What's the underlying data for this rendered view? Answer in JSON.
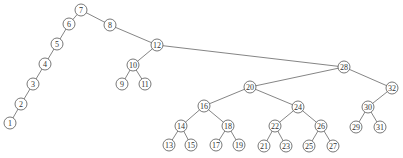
{
  "diagram": {
    "type": "binary-tree",
    "node_radius": 6,
    "colors": {
      "edge": "#666666",
      "node_stroke": "#555555",
      "node_fill": "#ffffff",
      "label": "#333333"
    },
    "nodes": [
      {
        "id": "7",
        "label": "7",
        "x": 81,
        "y": 10
      },
      {
        "id": "6",
        "label": "6",
        "x": 69,
        "y": 24
      },
      {
        "id": "5",
        "label": "5",
        "x": 57,
        "y": 44
      },
      {
        "id": "4",
        "label": "4",
        "x": 45,
        "y": 64
      },
      {
        "id": "3",
        "label": "3",
        "x": 33,
        "y": 84
      },
      {
        "id": "2",
        "label": "2",
        "x": 21,
        "y": 104
      },
      {
        "id": "1",
        "label": "1",
        "x": 10,
        "y": 123
      },
      {
        "id": "8",
        "label": "8",
        "x": 110,
        "y": 25
      },
      {
        "id": "12",
        "label": "12",
        "x": 157,
        "y": 45
      },
      {
        "id": "10",
        "label": "10",
        "x": 133,
        "y": 65
      },
      {
        "id": "9",
        "label": "9",
        "x": 122,
        "y": 84
      },
      {
        "id": "11",
        "label": "11",
        "x": 145,
        "y": 84
      },
      {
        "id": "28",
        "label": "28",
        "x": 344,
        "y": 67
      },
      {
        "id": "20",
        "label": "20",
        "x": 250,
        "y": 87
      },
      {
        "id": "16",
        "label": "16",
        "x": 204,
        "y": 106
      },
      {
        "id": "14",
        "label": "14",
        "x": 181,
        "y": 126
      },
      {
        "id": "18",
        "label": "18",
        "x": 228,
        "y": 126
      },
      {
        "id": "13",
        "label": "13",
        "x": 169,
        "y": 145
      },
      {
        "id": "15",
        "label": "15",
        "x": 191,
        "y": 145
      },
      {
        "id": "17",
        "label": "17",
        "x": 216,
        "y": 145
      },
      {
        "id": "19",
        "label": "19",
        "x": 239,
        "y": 145
      },
      {
        "id": "24",
        "label": "24",
        "x": 298,
        "y": 107
      },
      {
        "id": "22",
        "label": "22",
        "x": 275,
        "y": 126
      },
      {
        "id": "26",
        "label": "26",
        "x": 321,
        "y": 126
      },
      {
        "id": "21",
        "label": "21",
        "x": 264,
        "y": 146
      },
      {
        "id": "23",
        "label": "23",
        "x": 286,
        "y": 146
      },
      {
        "id": "25",
        "label": "25",
        "x": 309,
        "y": 146
      },
      {
        "id": "27",
        "label": "27",
        "x": 333,
        "y": 146
      },
      {
        "id": "32",
        "label": "32",
        "x": 392,
        "y": 88
      },
      {
        "id": "30",
        "label": "30",
        "x": 368,
        "y": 107
      },
      {
        "id": "29",
        "label": "29",
        "x": 356,
        "y": 127
      },
      {
        "id": "31",
        "label": "31",
        "x": 380,
        "y": 127
      }
    ],
    "edges": [
      [
        "7",
        "6"
      ],
      [
        "6",
        "5"
      ],
      [
        "5",
        "4"
      ],
      [
        "4",
        "3"
      ],
      [
        "3",
        "2"
      ],
      [
        "2",
        "1"
      ],
      [
        "7",
        "8"
      ],
      [
        "8",
        "12"
      ],
      [
        "12",
        "10"
      ],
      [
        "10",
        "9"
      ],
      [
        "10",
        "11"
      ],
      [
        "12",
        "28"
      ],
      [
        "28",
        "20"
      ],
      [
        "20",
        "16"
      ],
      [
        "16",
        "14"
      ],
      [
        "16",
        "18"
      ],
      [
        "14",
        "13"
      ],
      [
        "14",
        "15"
      ],
      [
        "18",
        "17"
      ],
      [
        "18",
        "19"
      ],
      [
        "20",
        "24"
      ],
      [
        "24",
        "22"
      ],
      [
        "24",
        "26"
      ],
      [
        "22",
        "21"
      ],
      [
        "22",
        "23"
      ],
      [
        "26",
        "25"
      ],
      [
        "26",
        "27"
      ],
      [
        "28",
        "32"
      ],
      [
        "32",
        "30"
      ],
      [
        "30",
        "29"
      ],
      [
        "30",
        "31"
      ]
    ]
  }
}
